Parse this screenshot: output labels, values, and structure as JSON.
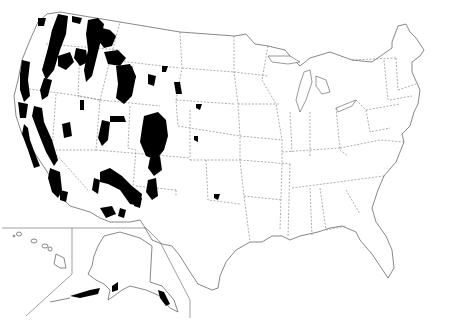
{
  "map": {
    "title": "",
    "subject": "Contiguous United States with Alaska and Hawaii insets; highlighted (black) regions concentrated in western mountain areas",
    "highlight_color": "#000000",
    "outline_color": "#555555",
    "background_color": "#ffffff",
    "insets": [
      "Hawaii",
      "Alaska"
    ],
    "highlighted_areas": [
      "Cascade Range (WA/OR)",
      "Sierra Nevada (CA)",
      "Coast Ranges (CA)",
      "Northern Rockies (ID/MT/WY)",
      "Yellowstone area (WY)",
      "Wasatch/Uinta (UT)",
      "Colorado Rockies (CO)",
      "Mogollon Rim (AZ/NM)",
      "Southern California mountains",
      "Black Hills (SD)",
      "Southeast Alaska / Alaska Peninsula"
    ],
    "labels": []
  }
}
